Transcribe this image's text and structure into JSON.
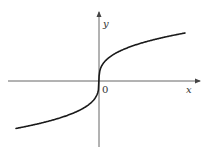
{
  "chart_data": {
    "type": "line",
    "title": "",
    "function": "y = cbrt(x)",
    "xlabel": "x",
    "ylabel": "y",
    "origin_label": "0",
    "grid": false,
    "legend": null,
    "xlim": [
      -8,
      8
    ],
    "ylim": [
      -2.1,
      2.8
    ],
    "series": [
      {
        "name": "y = cbrt(x)",
        "x": [
          -8,
          -6,
          -4,
          -2,
          -1,
          -0.5,
          -0.125,
          0,
          0.125,
          0.5,
          1,
          2,
          4,
          6,
          8
        ],
        "y": [
          -2,
          -1.817,
          -1.587,
          -1.26,
          -1,
          -0.794,
          -0.5,
          0,
          0.5,
          0.794,
          1,
          1.26,
          1.587,
          1.817,
          2
        ]
      }
    ]
  },
  "colors": {
    "curve": "#1a1a1a",
    "axes": "#555555",
    "background": "#ffffff"
  },
  "layout": {
    "origin_px": [
      99,
      81
    ],
    "x_axis_px": [
      8,
      200
    ],
    "y_axis_px": [
      12,
      147
    ],
    "curve_x_px": [
      16,
      185
    ],
    "curve_half_height_px": 48
  }
}
